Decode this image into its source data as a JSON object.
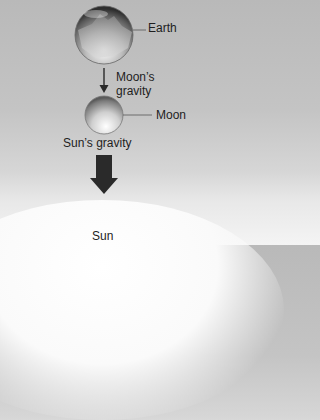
{
  "diagram": {
    "labels": {
      "earth": "Earth",
      "moon_gravity_line1": "Moon’s",
      "moon_gravity_line2": "gravity",
      "moon": "Moon",
      "sun_gravity": "Sun’s gravity",
      "sun": "Sun"
    },
    "colors": {
      "background_top": "#b9b9b9",
      "background_bottom": "#f4f4f4",
      "arrow": "#2a2a2a",
      "leader_line": "#555555"
    }
  }
}
